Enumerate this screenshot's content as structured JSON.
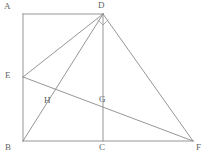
{
  "figure": {
    "background_color": "#ffffff",
    "line_color": "#8a8a8a",
    "label_color": "#5f5f5f",
    "width": 208,
    "height": 156,
    "points": [
      {
        "id": "A",
        "label": "A",
        "x": 23,
        "y": 14,
        "label_x": 4,
        "label_y": 2,
        "kind": "corner"
      },
      {
        "id": "D",
        "label": "D",
        "x": 103,
        "y": 14,
        "label_x": 98,
        "label_y": 1,
        "kind": "apex"
      },
      {
        "id": "E",
        "label": "E",
        "x": 23,
        "y": 77,
        "label_x": 5,
        "label_y": 71,
        "kind": "on-segment"
      },
      {
        "id": "H",
        "label": "H",
        "x": 50,
        "y": 95,
        "label_x": 44,
        "label_y": 96,
        "kind": "intersection"
      },
      {
        "id": "G",
        "label": "G",
        "x": 103,
        "y": 99,
        "label_x": 99,
        "label_y": 95,
        "kind": "intersection"
      },
      {
        "id": "B",
        "label": "B",
        "x": 23,
        "y": 141,
        "label_x": 5,
        "label_y": 143,
        "kind": "corner"
      },
      {
        "id": "C",
        "label": "C",
        "x": 103,
        "y": 141,
        "label_x": 99,
        "label_y": 143,
        "kind": "on-segment"
      },
      {
        "id": "F",
        "label": "F",
        "x": 193,
        "y": 141,
        "label_x": 196,
        "label_y": 143,
        "kind": "corner"
      }
    ],
    "segments": [
      {
        "id": "AD",
        "from": "A",
        "to": "D",
        "x1": 23,
        "y1": 14,
        "x2": 103,
        "y2": 14
      },
      {
        "id": "AB",
        "from": "A",
        "to": "B",
        "x1": 23,
        "y1": 14,
        "x2": 23,
        "y2": 141
      },
      {
        "id": "BF",
        "from": "B",
        "to": "F",
        "x1": 23,
        "y1": 141,
        "x2": 193,
        "y2": 141
      },
      {
        "id": "DC",
        "from": "D",
        "to": "C",
        "x1": 103,
        "y1": 14,
        "x2": 103,
        "y2": 141
      },
      {
        "id": "DE",
        "from": "D",
        "to": "E",
        "x1": 103,
        "y1": 14,
        "x2": 23,
        "y2": 77
      },
      {
        "id": "DB",
        "from": "D",
        "to": "B",
        "x1": 103,
        "y1": 14,
        "x2": 23,
        "y2": 141
      },
      {
        "id": "DF",
        "from": "D",
        "to": "F",
        "x1": 103,
        "y1": 14,
        "x2": 193,
        "y2": 141
      },
      {
        "id": "EF",
        "from": "E",
        "to": "F",
        "x1": 23,
        "y1": 77,
        "x2": 193,
        "y2": 141
      }
    ],
    "angle_markers": [
      {
        "id": "right-angle-at-D",
        "at": "D",
        "path": "M 97.5 19.5 L 103 25 L 108.5 19.5"
      }
    ]
  }
}
